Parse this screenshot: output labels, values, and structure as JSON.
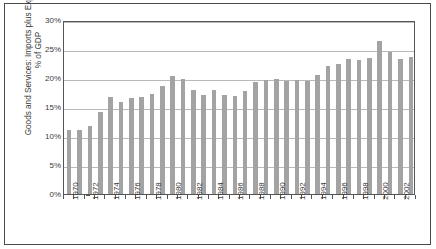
{
  "chart_data": {
    "type": "bar",
    "title": "",
    "xlabel": "",
    "ylabel": "Goods and Services: Imports plus Exports as a % of GDP",
    "ylim": [
      0,
      30
    ],
    "ytick_labels": [
      "0%",
      "5%",
      "10%",
      "15%",
      "20%",
      "25%",
      "30%"
    ],
    "ytick_values": [
      0,
      5,
      10,
      15,
      20,
      25,
      30
    ],
    "grid": true,
    "legend": null,
    "bar_color": "#a3a3a3",
    "xtick_labels": [
      "1970",
      "1972",
      "1974",
      "1976",
      "1978",
      "1980",
      "1982",
      "1984",
      "1986",
      "1988",
      "1990",
      "1992",
      "1994",
      "1996",
      "1998",
      "2000",
      "2002"
    ],
    "categories": [
      "1970",
      "1971",
      "1972",
      "1973",
      "1974",
      "1975",
      "1976",
      "1977",
      "1978",
      "1979",
      "1980",
      "1981",
      "1982",
      "1983",
      "1984",
      "1985",
      "1986",
      "1987",
      "1988",
      "1989",
      "1990",
      "1991",
      "1992",
      "1993",
      "1994",
      "1995",
      "1996",
      "1997",
      "1998",
      "1999",
      "2000",
      "2001",
      "2002",
      "2003"
    ],
    "values": [
      11.1,
      11.0,
      11.8,
      14.1,
      16.8,
      15.9,
      16.6,
      16.8,
      17.2,
      18.7,
      20.3,
      19.9,
      17.9,
      17.0,
      17.9,
      17.0,
      16.9,
      17.8,
      19.3,
      19.6,
      19.9,
      19.4,
      19.6,
      19.4,
      20.6,
      22.1,
      22.4,
      23.2,
      23.1,
      23.4,
      26.3,
      24.4,
      23.3,
      23.7
    ]
  }
}
